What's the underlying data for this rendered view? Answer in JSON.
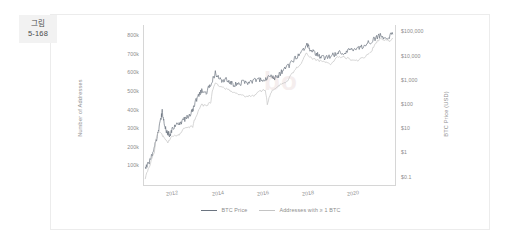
{
  "figure_tag": {
    "line1": "그림",
    "line2": "5-168"
  },
  "watermark": "bo",
  "legend": [
    {
      "label": "BTC Price",
      "color": "#8f9aa8"
    },
    {
      "label": "Addresses with ≥ 1 BTC",
      "color": "#c9c9c9"
    }
  ],
  "colors": {
    "price_line": "#6b7480",
    "address_line": "#c4c4c4",
    "axis": "#d6d6d6",
    "tick_text": "#8c8c8c",
    "card_border": "#ececec",
    "tag_bg": "#f2f2f2",
    "background": "#ffffff"
  },
  "chart_data": {
    "type": "line",
    "title": "",
    "xlabel": "",
    "ylabel": "Number of Addresses",
    "ylabel_right": "BTC Price (USD)",
    "grid": false,
    "legend_position": "bottom-center",
    "x_ticks": [
      "2012",
      "2014",
      "2016",
      "2018",
      "2020"
    ],
    "xlim": [
      "2010.7",
      "2021.8"
    ],
    "y_left_ticks": [
      "100k",
      "200k",
      "300k",
      "400k",
      "500k",
      "600k",
      "700k",
      "800k"
    ],
    "y_left_lim": [
      0,
      860000
    ],
    "y_right_ticks": [
      "$0.1",
      "$1",
      "$10",
      "$100",
      "$1,000",
      "$10,000",
      "$100,000"
    ],
    "y_right_scale": "log",
    "y_right_lim": [
      0.05,
      200000
    ],
    "series": [
      {
        "name": "Addresses with ≥ 1 BTC",
        "axis": "left",
        "color": "#6b7480",
        "x": [
          2010.8,
          2010.95,
          2011.1,
          2011.2,
          2011.3,
          2011.4,
          2011.5,
          2011.55,
          2011.62,
          2011.7,
          2011.8,
          2011.9,
          2012.0,
          2012.15,
          2012.3,
          2012.45,
          2012.6,
          2012.75,
          2012.9,
          2013.0,
          2013.15,
          2013.3,
          2013.45,
          2013.6,
          2013.75,
          2013.9,
          2014.0,
          2014.1,
          2014.2,
          2014.35,
          2014.5,
          2014.65,
          2014.8,
          2015.0,
          2015.2,
          2015.4,
          2015.6,
          2015.8,
          2016.0,
          2016.2,
          2016.4,
          2016.55,
          2016.7,
          2016.85,
          2017.0,
          2017.2,
          2017.4,
          2017.6,
          2017.8,
          2017.95,
          2018.05,
          2018.15,
          2018.3,
          2018.45,
          2018.6,
          2018.8,
          2019.0,
          2019.2,
          2019.4,
          2019.6,
          2019.8,
          2020.0,
          2020.2,
          2020.4,
          2020.6,
          2020.8,
          2021.0,
          2021.2,
          2021.4,
          2021.6,
          2021.75
        ],
        "y": [
          85000,
          120000,
          160000,
          205000,
          245000,
          300000,
          360000,
          395000,
          340000,
          300000,
          280000,
          265000,
          300000,
          320000,
          330000,
          345000,
          360000,
          375000,
          400000,
          440000,
          480000,
          505000,
          490000,
          520000,
          560000,
          600000,
          590000,
          575000,
          560000,
          570000,
          555000,
          545000,
          540000,
          545000,
          555000,
          548000,
          560000,
          565000,
          570000,
          575000,
          585000,
          575000,
          590000,
          610000,
          625000,
          645000,
          675000,
          700000,
          730000,
          755000,
          740000,
          720000,
          710000,
          700000,
          690000,
          685000,
          695000,
          705000,
          710000,
          705000,
          720000,
          730000,
          735000,
          740000,
          760000,
          775000,
          790000,
          805000,
          790000,
          800000,
          810000
        ]
      },
      {
        "name": "BTC Price",
        "axis": "right",
        "color": "#c4c4c4",
        "x": [
          2010.8,
          2011.0,
          2011.2,
          2011.4,
          2011.6,
          2011.8,
          2012.0,
          2012.3,
          2012.6,
          2012.9,
          2013.1,
          2013.3,
          2013.5,
          2013.7,
          2013.9,
          2014.1,
          2014.4,
          2014.7,
          2015.0,
          2015.3,
          2015.6,
          2015.9,
          2016.1,
          2016.2,
          2016.35,
          2016.5,
          2016.7,
          2016.9,
          2017.1,
          2017.4,
          2017.7,
          2017.95,
          2018.1,
          2018.4,
          2018.7,
          2019.0,
          2019.3,
          2019.6,
          2019.9,
          2020.2,
          2020.5,
          2020.8,
          2021.0,
          2021.2,
          2021.4,
          2021.6,
          2021.75
        ],
        "y": [
          0.08,
          0.3,
          1.0,
          8.0,
          5.0,
          3.0,
          5.0,
          6.0,
          12.0,
          13.0,
          40.0,
          100.0,
          90.0,
          130.0,
          800.0,
          600.0,
          450.0,
          350.0,
          250.0,
          230.0,
          250.0,
          380.0,
          420.0,
          95.0,
          300.0,
          450.0,
          600.0,
          750.0,
          1000.0,
          2500.0,
          5000.0,
          14000.0,
          9000.0,
          7000.0,
          6400.0,
          5000.0,
          9000.0,
          9500.0,
          7200.0,
          6800.0,
          9500.0,
          15000.0,
          35000.0,
          55000.0,
          50000.0,
          45000.0,
          55000.0
        ]
      }
    ]
  }
}
